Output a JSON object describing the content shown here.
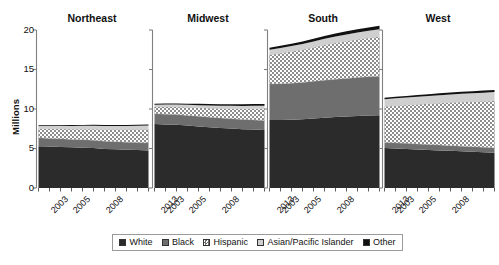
{
  "chart_data": {
    "type": "area",
    "title": "",
    "subtitle": "",
    "xlabel": "",
    "ylabel": "Millions",
    "ylim": [
      0,
      20
    ],
    "yticks": [
      0,
      5,
      10,
      15,
      20
    ],
    "ytick_labels": [
      "0",
      "5",
      "10",
      "15",
      "20"
    ],
    "grid": false,
    "legend_position": "bottom-center",
    "stacked": true,
    "x": [
      2003,
      2004,
      2005,
      2006,
      2007,
      2008,
      2009,
      2010,
      2011,
      2012,
      2013
    ],
    "xtick_labels": [
      "2003",
      "2005",
      "2008",
      "2013"
    ],
    "xtick_values": [
      2003,
      2005,
      2008,
      2013
    ],
    "series_names": [
      "White",
      "Black",
      "Hispanic",
      "Asian/Pacific Islander",
      "Other"
    ],
    "series_colors": {
      "White": "#2b2b2b",
      "Black": "#6e6e6e",
      "Hispanic": "#ffffff",
      "Asian/Pacific Islander": "#cfcfcf",
      "Other": "#111111"
    },
    "series_patterns": {
      "White": "solid",
      "Black": "solid",
      "Hispanic": "checker",
      "Asian/Pacific Islander": "solid",
      "Other": "solid"
    },
    "panels": [
      {
        "name": "Northeast",
        "series": [
          {
            "name": "White",
            "values": [
              5.3,
              5.25,
              5.2,
              5.15,
              5.1,
              5.05,
              4.95,
              4.9,
              4.85,
              4.8,
              4.75
            ]
          },
          {
            "name": "Black",
            "values": [
              1.05,
              1.03,
              1.02,
              1.0,
              1.0,
              0.98,
              0.97,
              0.96,
              0.95,
              0.95,
              0.95
            ]
          },
          {
            "name": "Hispanic",
            "values": [
              1.15,
              1.2,
              1.25,
              1.3,
              1.35,
              1.42,
              1.48,
              1.54,
              1.6,
              1.66,
              1.72
            ]
          },
          {
            "name": "Asian/Pacific Islander",
            "values": [
              0.38,
              0.39,
              0.4,
              0.41,
              0.42,
              0.43,
              0.44,
              0.45,
              0.46,
              0.47,
              0.48
            ]
          },
          {
            "name": "Other",
            "values": [
              0.1,
              0.1,
              0.1,
              0.11,
              0.11,
              0.12,
              0.12,
              0.13,
              0.13,
              0.14,
              0.14
            ]
          }
        ],
        "totals": [
          7.98,
          7.97,
          7.97,
          7.97,
          7.98,
          8.0,
          7.96,
          7.98,
          7.99,
          8.02,
          8.04
        ]
      },
      {
        "name": "Midwest",
        "series": [
          {
            "name": "White",
            "values": [
              8.1,
              8.05,
              8.0,
              7.9,
              7.8,
              7.7,
              7.6,
              7.52,
              7.45,
              7.4,
              7.35
            ]
          },
          {
            "name": "Black",
            "values": [
              1.3,
              1.3,
              1.29,
              1.28,
              1.27,
              1.26,
              1.25,
              1.24,
              1.23,
              1.22,
              1.21
            ]
          },
          {
            "name": "Hispanic",
            "values": [
              0.85,
              0.9,
              0.95,
              1.02,
              1.08,
              1.14,
              1.2,
              1.27,
              1.33,
              1.4,
              1.46
            ]
          },
          {
            "name": "Asian/Pacific Islander",
            "values": [
              0.3,
              0.31,
              0.32,
              0.33,
              0.34,
              0.35,
              0.36,
              0.37,
              0.38,
              0.39,
              0.4
            ]
          },
          {
            "name": "Other",
            "values": [
              0.12,
              0.13,
              0.14,
              0.15,
              0.16,
              0.17,
              0.18,
              0.19,
              0.2,
              0.21,
              0.22
            ]
          }
        ],
        "totals": [
          10.67,
          10.69,
          10.7,
          10.68,
          10.65,
          10.62,
          10.59,
          10.59,
          10.59,
          10.62,
          10.64
        ]
      },
      {
        "name": "South",
        "series": [
          {
            "name": "White",
            "values": [
              8.6,
              8.62,
              8.65,
              8.7,
              8.8,
              8.9,
              8.98,
              9.05,
              9.12,
              9.18,
              9.22
            ]
          },
          {
            "name": "Black",
            "values": [
              4.55,
              4.58,
              4.62,
              4.66,
              4.7,
              4.74,
              4.78,
              4.82,
              4.86,
              4.9,
              4.94
            ]
          },
          {
            "name": "Hispanic",
            "values": [
              3.7,
              3.85,
              4.0,
              4.15,
              4.3,
              4.45,
              4.6,
              4.72,
              4.82,
              4.9,
              4.98
            ]
          },
          {
            "name": "Asian/Pacific Islander",
            "values": [
              0.65,
              0.68,
              0.7,
              0.73,
              0.76,
              0.79,
              0.82,
              0.85,
              0.88,
              0.91,
              0.94
            ]
          },
          {
            "name": "Other",
            "values": [
              0.25,
              0.27,
              0.29,
              0.31,
              0.33,
              0.35,
              0.37,
              0.39,
              0.41,
              0.43,
              0.45
            ]
          }
        ],
        "totals": [
          17.75,
          18.0,
          18.26,
          18.55,
          18.89,
          19.23,
          19.55,
          19.83,
          20.09,
          20.32,
          20.53
        ]
      },
      {
        "name": "West",
        "series": [
          {
            "name": "White",
            "values": [
              5.05,
              5.0,
              4.95,
              4.88,
              4.82,
              4.76,
              4.7,
              4.64,
              4.58,
              4.52,
              4.46
            ]
          },
          {
            "name": "Black",
            "values": [
              0.72,
              0.71,
              0.7,
              0.69,
              0.68,
              0.67,
              0.66,
              0.65,
              0.64,
              0.63,
              0.62
            ]
          },
          {
            "name": "Hispanic",
            "values": [
              4.55,
              4.7,
              4.85,
              5.0,
              5.15,
              5.3,
              5.45,
              5.58,
              5.7,
              5.82,
              5.94
            ]
          },
          {
            "name": "Asian/Pacific Islander",
            "values": [
              0.92,
              0.94,
              0.96,
              0.98,
              1.0,
              1.02,
              1.04,
              1.06,
              1.08,
              1.1,
              1.12
            ]
          },
          {
            "name": "Other",
            "values": [
              0.18,
              0.19,
              0.2,
              0.21,
              0.22,
              0.23,
              0.24,
              0.25,
              0.26,
              0.27,
              0.28
            ]
          }
        ],
        "totals": [
          11.42,
          11.54,
          11.66,
          11.76,
          11.87,
          11.98,
          12.09,
          12.18,
          12.26,
          12.34,
          12.42
        ]
      }
    ],
    "legend_entries": [
      {
        "label": "White",
        "color": "#2b2b2b",
        "pattern": "solid"
      },
      {
        "label": "Black",
        "color": "#6e6e6e",
        "pattern": "solid"
      },
      {
        "label": "Hispanic",
        "color": "#ffffff",
        "pattern": "checker"
      },
      {
        "label": "Asian/Pacific Islander",
        "color": "#cfcfcf",
        "pattern": "solid"
      },
      {
        "label": "Other",
        "color": "#111111",
        "pattern": "solid"
      }
    ]
  }
}
